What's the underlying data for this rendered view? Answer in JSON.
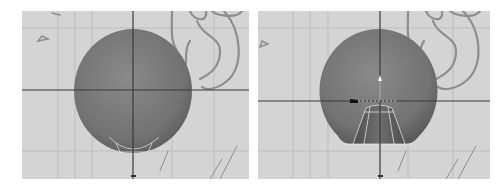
{
  "figure": {
    "panels": [
      {
        "id": "left",
        "view": "front orthographic viewport",
        "object": "sphere",
        "selection": "bottom faces of sphere (highlighted)",
        "reference_image": "ear sketch"
      },
      {
        "id": "right",
        "view": "front orthographic viewport",
        "object": "sphere",
        "selection": "bottom faces extruded inward (tapered cylinder)",
        "gizmo": "move manipulator",
        "reference_image": "ear sketch"
      }
    ]
  },
  "colors": {
    "background": "#ffffff",
    "viewport_bg": "#d4d4d4",
    "grid_line": "#bdbdbd",
    "axis_line": "#3a3a3a",
    "sphere_fill": "#7a7a7a",
    "sphere_shadow": "#5e5e5e",
    "ear_stroke": "#8e8e8e",
    "wire_highlight": "#f0f0f0"
  }
}
